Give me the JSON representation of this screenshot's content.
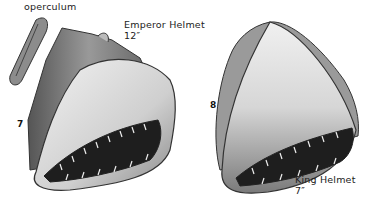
{
  "plate": {
    "labels": {
      "operculum": "operculum",
      "emperor_name": "Emperor Helmet",
      "emperor_size": "12″",
      "emperor_number": "7",
      "king_number": "8",
      "king_name": "King Helmet",
      "king_size": "7″"
    },
    "colors": {
      "background": "#ffffff",
      "shell_light": "#e6e6e6",
      "shell_mid": "#a8a8a8",
      "shell_dark": "#3a3a3a",
      "aperture": "#1e1e1e"
    }
  }
}
